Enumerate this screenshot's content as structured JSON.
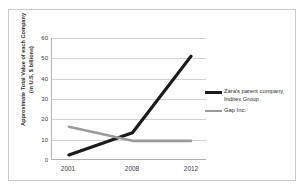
{
  "chart_data": {
    "type": "line",
    "title": "",
    "xlabel": "",
    "ylabel": "Approximate Total Value of each Company (in U.S. $ billions)",
    "ylabel_line1": "Approximate Total Value of each Company",
    "ylabel_line2": "(in U.S. $ billions)",
    "x": [
      2001,
      2008,
      2012
    ],
    "categories": [
      "2001",
      "2008",
      "2012"
    ],
    "xtick_labels": [
      "2001",
      "2008",
      "2012"
    ],
    "ytick_labels": [
      "0",
      "10",
      "20",
      "30",
      "40",
      "50",
      "60"
    ],
    "ytick_values": [
      0,
      10,
      20,
      30,
      40,
      50,
      60
    ],
    "ylim": [
      0,
      60
    ],
    "xlim": [
      2001,
      2012
    ],
    "grid": true,
    "grid_axis": "y",
    "legend_position": "right",
    "series": [
      {
        "name": "Zara's parent company, Inditex Group",
        "name_line1": "Zara's parent company,",
        "name_line2": "Inditex Group",
        "values": [
          2,
          13,
          51
        ],
        "color": "#1a1a1a",
        "width": 3.2
      },
      {
        "name": "Gap Inc.",
        "name_line1": "Gap Inc.",
        "name_line2": "",
        "values": [
          16,
          9,
          9
        ],
        "color": "#9a9a9a",
        "width": 2.6
      }
    ]
  },
  "legend": {
    "entries": [
      {
        "label_line1": "Zara's parent company,",
        "label_line2": "Inditex Group"
      },
      {
        "label_line1": "Gap Inc.",
        "label_line2": ""
      }
    ]
  },
  "colors": {
    "zara": "#1a1a1a",
    "gap": "#9a9a9a",
    "gridline": "#d2d2d2",
    "axis": "#b0b0b0",
    "frame": "#c9c9c9",
    "background": "#ffffff"
  }
}
